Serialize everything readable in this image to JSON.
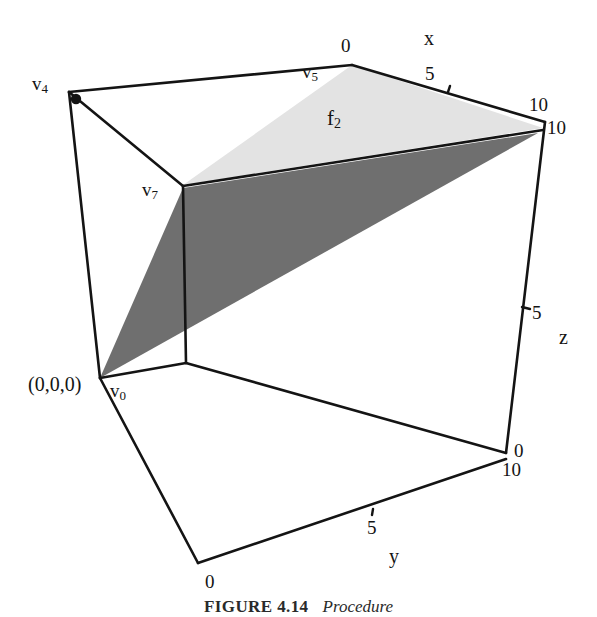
{
  "figure": {
    "caption_label": "FIGURE 4.14",
    "caption_text": "Procedure",
    "background_color": "#ffffff",
    "line_color": "#141414"
  },
  "shapes": {
    "face_light": {
      "name": "f2",
      "fill_color": "#e2e2e2",
      "label": "f",
      "label_sub": "2"
    },
    "face_dark": {
      "fill_color": "#6e6e6e"
    }
  },
  "vertices": [
    {
      "id": "v4",
      "label": "v",
      "sub": "4"
    },
    {
      "id": "v5",
      "label": "v",
      "sub": "5"
    },
    {
      "id": "v7",
      "label": "v",
      "sub": "7"
    },
    {
      "id": "v0",
      "label": "v",
      "sub": "0"
    }
  ],
  "origin": {
    "label": "(0,0,0)"
  },
  "axes": [
    {
      "id": "x",
      "label": "x",
      "ticks": [
        {
          "value": "0"
        },
        {
          "value": "5"
        },
        {
          "value": "10"
        }
      ]
    },
    {
      "id": "y",
      "label": "y",
      "ticks": [
        {
          "value": "0"
        },
        {
          "value": "5"
        },
        {
          "value": "10"
        }
      ]
    },
    {
      "id": "z",
      "label": "z",
      "ticks": [
        {
          "value": "0"
        },
        {
          "value": "5"
        },
        {
          "value": "10"
        }
      ]
    }
  ],
  "tick_labels": {
    "x_zero": "0",
    "x_five": "5",
    "x_ten": "10",
    "y_zero": "0",
    "y_five": "5",
    "y_ten": "10",
    "z_zero": "0",
    "z_five": "5",
    "z_ten": "10"
  },
  "axis_names": {
    "x": "x",
    "y": "y",
    "z": "z"
  },
  "vertex_labels": {
    "v4_base": "v",
    "v4_sub": "4",
    "v5_base": "v",
    "v5_sub": "5",
    "v7_base": "v",
    "v7_sub": "7",
    "v0_base": "v",
    "v0_sub": "0"
  },
  "face_label": {
    "base": "f",
    "sub": "2"
  }
}
